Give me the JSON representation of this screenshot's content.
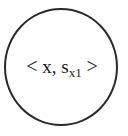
{
  "diagram": {
    "node": {
      "shape": "circle",
      "stroke_color": "#2a2a2a",
      "label": {
        "open_bracket": "<",
        "var": "x",
        "separator": ", ",
        "symbol": "s",
        "subscript": "x1",
        "close_bracket": ">"
      }
    }
  }
}
